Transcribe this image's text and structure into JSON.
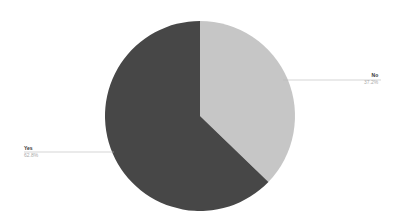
{
  "chart_data": {
    "type": "pie",
    "title": "",
    "categories": [
      "No",
      "Yes"
    ],
    "values": [
      37.2,
      62.8
    ],
    "labels": [
      "37.2%",
      "62.8%"
    ],
    "colors": [
      "#c6c6c6",
      "#474747"
    ],
    "start_angle_deg": 0,
    "direction": "clockwise",
    "legend": "none",
    "label_style": "leader-lines"
  },
  "labels": {
    "no": {
      "name": "No",
      "pct": "37.2%"
    },
    "yes": {
      "name": "Yes",
      "pct": "62.8%"
    }
  }
}
